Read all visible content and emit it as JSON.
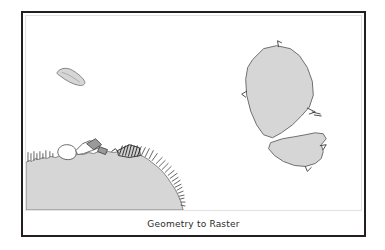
{
  "figure": {
    "caption": "Geometry to Raster",
    "frame": {
      "outer_border_color": "#231f20",
      "inner_border_color": "#e2e2e2",
      "background_color": "#ffffff"
    }
  },
  "map": {
    "land_fill_color": "#d6d6d6",
    "land_stroke_color": "#6d6d6d",
    "tick_mark_color": "#4a4a4a",
    "hatch_cluster_color": "#2a2a2a",
    "features": [
      {
        "name": "mainland-coastline",
        "label": "mainland landmass with jagged raster-cell coastline",
        "position": "bottom-left"
      },
      {
        "name": "small-island",
        "label": "small elongated island",
        "position": "upper-left"
      },
      {
        "name": "large-island-north",
        "label": "large octagonal island",
        "position": "right-upper"
      },
      {
        "name": "large-island-south",
        "label": "irregular island south of large island",
        "position": "right-lower"
      }
    ]
  }
}
